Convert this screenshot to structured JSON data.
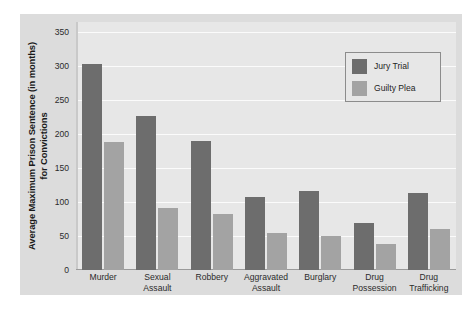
{
  "chart_data": {
    "type": "bar",
    "title": "",
    "xlabel": "",
    "ylabel": "Average Maximum Prison Sentence (in months) for Convictions",
    "ylabel_line1": "Average Maximum Prison Sentence (in months)",
    "ylabel_line2": "for Convictions",
    "categories": [
      "Murder",
      "Sexual Assault",
      "Robbery",
      "Aggravated Assault",
      "Burglary",
      "Drug Possession",
      "Drug Trafficking"
    ],
    "category_lines": [
      [
        "Murder"
      ],
      [
        "Sexual",
        "Assault"
      ],
      [
        "Robbery"
      ],
      [
        "Aggravated",
        "Assault"
      ],
      [
        "Burglary"
      ],
      [
        "Drug",
        "Possession"
      ],
      [
        "Drug",
        "Trafficking"
      ]
    ],
    "series": [
      {
        "name": "Jury Trial",
        "color": "#6d6d6d",
        "values": [
          303,
          227,
          190,
          107,
          117,
          69,
          113
        ]
      },
      {
        "name": "Guilty Plea",
        "color": "#a3a3a3",
        "values": [
          188,
          92,
          82,
          55,
          50,
          39,
          60
        ]
      }
    ],
    "ylim": [
      0,
      365
    ],
    "yticks": [
      0,
      50,
      100,
      150,
      200,
      250,
      300,
      350
    ],
    "ytick_labels": [
      "0",
      "50",
      "100",
      "150",
      "200",
      "250",
      "300",
      "350"
    ],
    "grid": true,
    "legend_position": "upper right",
    "plot_background": "#e7e7e7",
    "canvas_background": "#dcdcdc",
    "gridline_color": "#fbfbfb"
  }
}
